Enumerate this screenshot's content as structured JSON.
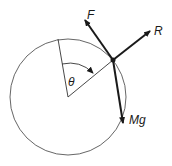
{
  "diagram": {
    "labels": {
      "friction": "F",
      "reaction": "R",
      "weight": "Mg",
      "angle": "θ"
    },
    "colors": {
      "stroke": "#1a1a1a",
      "circle": "#555555"
    }
  }
}
